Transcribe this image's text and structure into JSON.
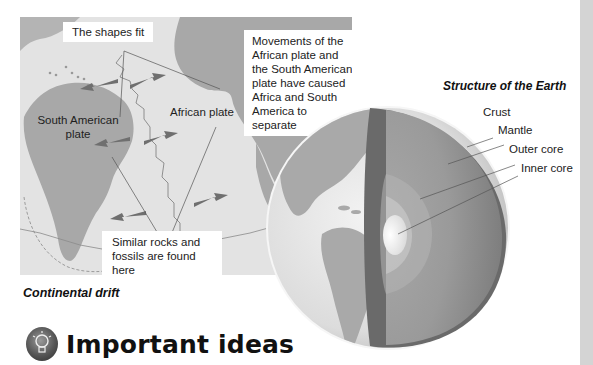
{
  "continental_drift": {
    "caption": "Continental drift",
    "labels": {
      "shapes_fit": "The shapes fit",
      "movements": [
        "Movements of the",
        "African plate and",
        "the South American",
        "plate have caused",
        "Africa and South",
        "America to",
        "separate"
      ],
      "south_american_plate": [
        "South American",
        "plate"
      ],
      "african_plate": "African plate",
      "similar_rocks": [
        "Similar rocks and",
        "fossils are found here"
      ]
    },
    "colors": {
      "land": "#a8a8a8",
      "ocean": "#e3e3e3",
      "arrow": "#6f6f6f"
    }
  },
  "earth_structure": {
    "title": "Structure of the Earth",
    "layers": [
      {
        "name": "Crust"
      },
      {
        "name": "Mantle"
      },
      {
        "name": "Outer core"
      },
      {
        "name": "Inner core"
      }
    ]
  },
  "section": {
    "heading": "Important ideas",
    "icon": "lightbulb-icon"
  }
}
